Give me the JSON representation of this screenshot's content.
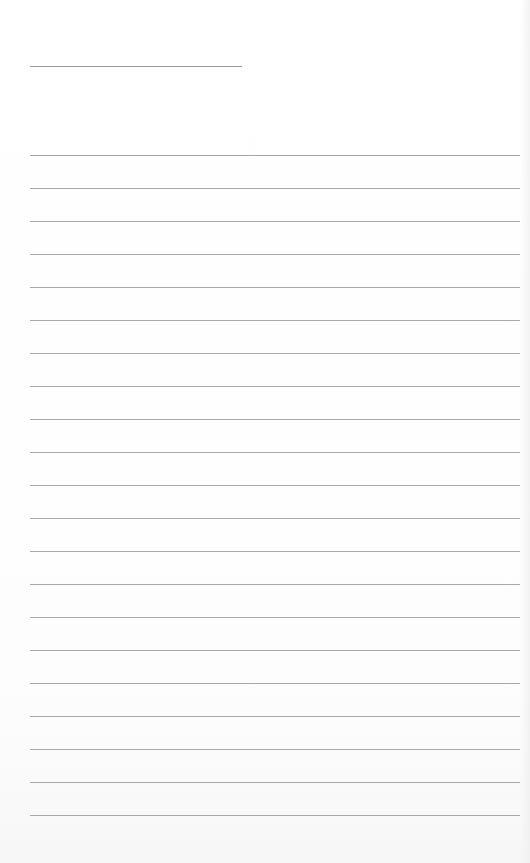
{
  "document": {
    "type": "lined-paper",
    "title_line": {
      "x": 30,
      "y": 66,
      "width": 212,
      "text": ""
    },
    "rules": {
      "count": 21,
      "start_y": 155,
      "spacing": 33,
      "x": 30,
      "width": 490,
      "color": "#a8a8a8"
    },
    "lines_text": [
      "",
      "",
      "",
      "",
      "",
      "",
      "",
      "",
      "",
      "",
      "",
      "",
      "",
      "",
      "",
      "",
      "",
      "",
      "",
      "",
      ""
    ]
  }
}
